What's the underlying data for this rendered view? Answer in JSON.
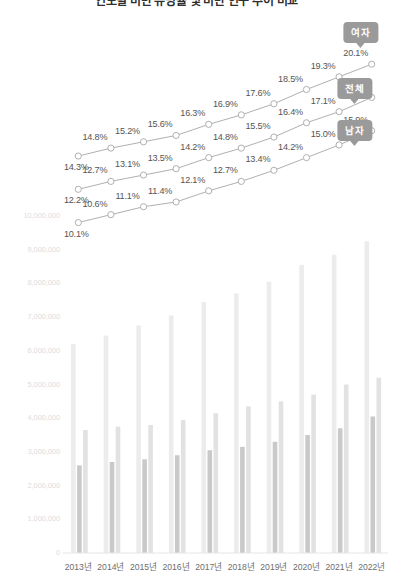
{
  "chart_data": {
    "type": "bar",
    "title": "연도별 비만 유병률 및 비만 인구 추이 비교",
    "xlabel": "",
    "ylabel": "",
    "grid": false,
    "legend_position": "right-inline-callouts",
    "categories": [
      "2013년",
      "2014년",
      "2015년",
      "2016년",
      "2017년",
      "2018년",
      "2019년",
      "2020년",
      "2021년",
      "2022년"
    ],
    "ylim": [
      0,
      10000000
    ],
    "y_ticks": [
      "0",
      "1,000,000",
      "2,000,000",
      "3,000,000",
      "4,000,000",
      "5,000,000",
      "6,000,000",
      "7,000,000",
      "8,000,000",
      "9,000,000",
      "10,000,000"
    ],
    "y_tick_values": [
      0,
      1000000,
      2000000,
      3000000,
      4000000,
      5000000,
      6000000,
      7000000,
      8000000,
      9000000,
      10000000
    ],
    "bar_series": [
      {
        "name": "전체",
        "color": "#ececec",
        "values": [
          6200000,
          6450000,
          6750000,
          7050000,
          7450000,
          7700000,
          8050000,
          8550000,
          8850000,
          9250000
        ]
      },
      {
        "name": "남자",
        "color": "#c9c9c9",
        "values": [
          2600000,
          2700000,
          2780000,
          2900000,
          3050000,
          3150000,
          3300000,
          3500000,
          3700000,
          4050000
        ]
      },
      {
        "name": "여자",
        "color": "#e2e2e2",
        "values": [
          3650000,
          3750000,
          3800000,
          3950000,
          4150000,
          4350000,
          4500000,
          4700000,
          5000000,
          5200000
        ]
      }
    ],
    "line_ylim": [
      9.0,
      21.5
    ],
    "line_series": [
      {
        "name": "여자",
        "color": "#b0b0b0",
        "labels": [
          "14.3%",
          "14.8%",
          "15.2%",
          "15.6%",
          "16.3%",
          "16.9%",
          "17.6%",
          "18.5%",
          "19.3%",
          "20.1%"
        ],
        "values": [
          14.3,
          14.8,
          15.2,
          15.6,
          16.3,
          16.9,
          17.6,
          18.5,
          19.3,
          20.1
        ]
      },
      {
        "name": "전체",
        "color": "#b0b0b0",
        "labels": [
          "12.2%",
          "12.7%",
          "13.1%",
          "13.5%",
          "14.2%",
          "14.8%",
          "15.5%",
          "16.4%",
          "17.1%",
          "18.0%"
        ],
        "values": [
          12.2,
          12.7,
          13.1,
          13.5,
          14.2,
          14.8,
          15.5,
          16.4,
          17.1,
          18.0
        ]
      },
      {
        "name": "남자",
        "color": "#b0b0b0",
        "labels": [
          "10.1%",
          "10.6%",
          "11.1%",
          "11.4%",
          "12.1%",
          "12.7%",
          "13.4%",
          "14.2%",
          "15.0%",
          "15.9%"
        ],
        "values": [
          10.1,
          10.6,
          11.1,
          11.4,
          12.1,
          12.7,
          13.4,
          14.2,
          15.0,
          15.9
        ]
      }
    ],
    "callouts": [
      {
        "label": "여자",
        "x": 378,
        "y": 22
      },
      {
        "label": "전체",
        "x": 372,
        "y": 78
      },
      {
        "label": "남자",
        "x": 372,
        "y": 120
      }
    ],
    "colors": {
      "bar_total": "#ececec",
      "bar_male": "#c9c9c9",
      "bar_female": "#e2e2e2",
      "line": "#b0b0b0",
      "marker_fill": "#ffffff",
      "value_label": "#555555",
      "axis_label": "#6d6d6d",
      "ytick_label": "#dcdcdc",
      "callout_bg": "#9a9a9a"
    }
  }
}
